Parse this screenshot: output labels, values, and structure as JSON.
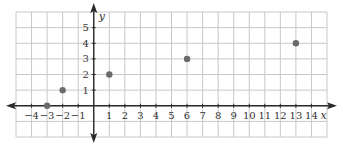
{
  "chart_data": {
    "type": "scatter",
    "title": "",
    "xlabel": "x",
    "ylabel": "y",
    "xlim": [
      -5,
      15
    ],
    "ylim": [
      -2,
      6
    ],
    "grid": true,
    "x_ticks": [
      -4,
      -3,
      -2,
      -1,
      1,
      2,
      3,
      4,
      5,
      6,
      7,
      8,
      9,
      10,
      11,
      12,
      13,
      14
    ],
    "y_ticks": [
      1,
      2,
      3,
      4,
      5
    ],
    "x_tick_labels": [
      "−4",
      "−3",
      "−2",
      "−1",
      "1",
      "2",
      "3",
      "4",
      "5",
      "6",
      "7",
      "8",
      "9",
      "10",
      "11",
      "12",
      "13",
      "14"
    ],
    "y_tick_labels": [
      "1",
      "2",
      "3",
      "4",
      "5"
    ],
    "series": [
      {
        "name": "points",
        "color": "#6b6b6b",
        "points": [
          {
            "x": -3,
            "y": 0
          },
          {
            "x": -2,
            "y": 1
          },
          {
            "x": 1,
            "y": 2
          },
          {
            "x": 6,
            "y": 3
          },
          {
            "x": 13,
            "y": 4
          }
        ]
      }
    ],
    "axis_arrows": {
      "x": "both",
      "y": "both"
    }
  },
  "colors": {
    "grid": "#c8c8c8",
    "axis": "#2a2a2a",
    "point": "#6b6b6b"
  }
}
